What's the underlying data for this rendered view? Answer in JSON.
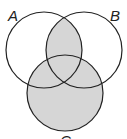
{
  "diagram": {
    "type": "venn",
    "sets": [
      {
        "label": "A",
        "cx": 44,
        "cy": 50,
        "r": 38
      },
      {
        "label": "B",
        "cx": 84,
        "cy": 50,
        "r": 38
      },
      {
        "label": "C",
        "cx": 65,
        "cy": 93,
        "r": 38
      }
    ],
    "shaded_region": "(A ∩ B) ∪ C",
    "colors": {
      "stroke": "#222222",
      "shade": "#d6d6d6",
      "background": "#ffffff"
    }
  },
  "labels": {
    "a": "A",
    "b": "B",
    "c": "C"
  }
}
